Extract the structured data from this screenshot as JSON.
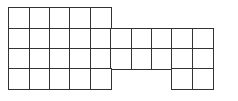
{
  "diagram": {
    "type": "grid-shape",
    "line_color": "#333333",
    "fill_color": "#ffffff",
    "origin": {
      "x": 9,
      "y": 8
    },
    "cell_size": 20.4,
    "rows": 4,
    "cols": 10,
    "row_spans": [
      {
        "row": 0,
        "cols": [
          0,
          1,
          2,
          3,
          4
        ]
      },
      {
        "row": 1,
        "cols": [
          0,
          1,
          2,
          3,
          4,
          5,
          6,
          7,
          8,
          9
        ]
      },
      {
        "row": 2,
        "cols": [
          0,
          1,
          2,
          3,
          4,
          5,
          6,
          7,
          8,
          9
        ]
      },
      {
        "row": 3,
        "cols": [
          0,
          1,
          2,
          3,
          4,
          8,
          9
        ]
      }
    ],
    "total_cells": 32
  }
}
